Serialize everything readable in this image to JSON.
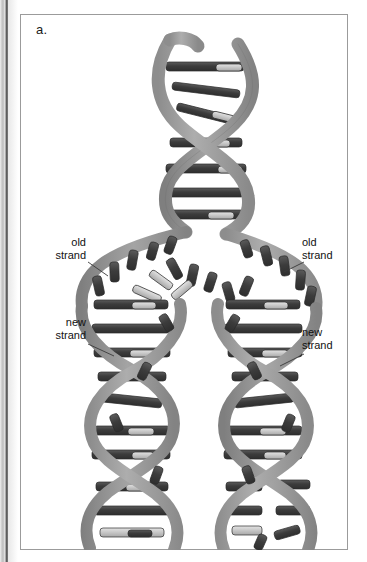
{
  "figure": {
    "panel_letter": "a.",
    "frame_border_color": "#9b9b9b",
    "background_color": "#ffffff"
  },
  "labels": {
    "old_strand_left": "old\nstrand",
    "new_strand_left": "new\nstrand",
    "old_strand_right": "old\nstrand",
    "new_strand_right": "new\nstrand"
  },
  "diagram": {
    "type": "dna-replication-fork",
    "colors": {
      "backbone": "#9a9a9a",
      "backbone_shadow": "#7e7e7e",
      "backbone_highlight": "#b5b5b5",
      "base_dark": "#3f3f3f",
      "base_mid": "#5a5a5a",
      "base_light": "#d6d6d6",
      "outline": "#2b2b2b"
    },
    "parent_helix": {
      "turns": 2,
      "top_y": 26,
      "fork_y": 196,
      "center_x": 184,
      "amplitude": 42,
      "period": 84
    },
    "daughter_helices": [
      {
        "name": "left-daughter",
        "center_x": 130,
        "top_y": 214,
        "bottom_y": 536,
        "turns": 4,
        "amplitude": 38,
        "period": 80
      },
      {
        "name": "right-daughter",
        "center_x": 246,
        "top_y": 214,
        "bottom_y": 536,
        "turns": 4,
        "amplitude": 38,
        "period": 80
      }
    ],
    "unpaired_bases_regions": [
      "fork-center",
      "right-daughter-bottom"
    ]
  }
}
